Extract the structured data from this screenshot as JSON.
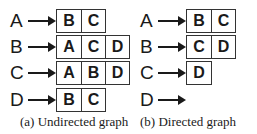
{
  "panels": [
    {
      "caption": "(a) Undirected graph",
      "rows": [
        {
          "vertex": "A",
          "neighbors": [
            "B",
            "C"
          ]
        },
        {
          "vertex": "B",
          "neighbors": [
            "A",
            "C",
            "D"
          ]
        },
        {
          "vertex": "C",
          "neighbors": [
            "A",
            "B",
            "D"
          ]
        },
        {
          "vertex": "D",
          "neighbors": [
            "B",
            "C"
          ]
        }
      ]
    },
    {
      "caption": "(b) Directed graph",
      "rows": [
        {
          "vertex": "A",
          "neighbors": [
            "B",
            "C"
          ]
        },
        {
          "vertex": "B",
          "neighbors": [
            "C",
            "D"
          ]
        },
        {
          "vertex": "C",
          "neighbors": [
            "D"
          ]
        },
        {
          "vertex": "D",
          "neighbors": []
        }
      ]
    }
  ]
}
